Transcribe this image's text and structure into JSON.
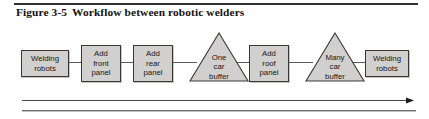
{
  "figure": {
    "label": "Figure 3-5",
    "title": "Workflow between robotic welders"
  },
  "diagram": {
    "type": "process-flow",
    "direction": "left-to-right",
    "nodes": [
      {
        "id": "welding-robots-start",
        "shape": "rectangle",
        "lines": [
          "Welding",
          "robots"
        ]
      },
      {
        "id": "add-front-panel",
        "shape": "rectangle",
        "lines": [
          "Add",
          "front",
          "panel"
        ]
      },
      {
        "id": "add-rear-panel",
        "shape": "rectangle",
        "lines": [
          "Add",
          "rear",
          "panel"
        ]
      },
      {
        "id": "one-car-buffer",
        "shape": "triangle",
        "lines": [
          "One",
          "car",
          "buffer"
        ]
      },
      {
        "id": "add-roof-panel",
        "shape": "rectangle",
        "lines": [
          "Add",
          "roof",
          "panel"
        ]
      },
      {
        "id": "many-car-buffer",
        "shape": "triangle",
        "lines": [
          "Many",
          "car",
          "buffer"
        ]
      },
      {
        "id": "welding-robots-end",
        "shape": "rectangle",
        "lines": [
          "Welding",
          "robots"
        ]
      }
    ],
    "flow_arrow": "flow-direction-arrow"
  },
  "colors": {
    "shape_fill": "#d2d0ce",
    "shape_stroke": "#3a3836",
    "connector": "#5d5b59",
    "text": "#151414",
    "rule": "#33312f"
  }
}
